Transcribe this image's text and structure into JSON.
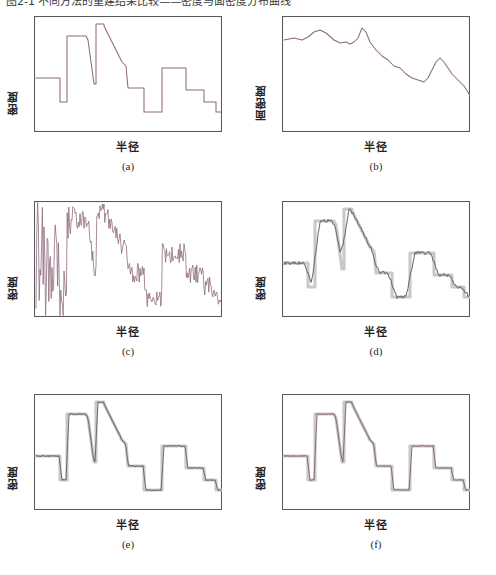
{
  "top_caption": "图2-1 不同方法的重建结果比较——密度与面密度分布曲线",
  "labels": {
    "density": "密度",
    "surface_density": "面密度",
    "radius": "半径"
  },
  "panels": [
    {
      "tag": "(a)",
      "ylabel": "密度",
      "xlabel": "半径",
      "name": "panel-a"
    },
    {
      "tag": "(b)",
      "ylabel": "面密度",
      "xlabel": "半径",
      "name": "panel-b"
    },
    {
      "tag": "(c)",
      "ylabel": "密度",
      "xlabel": "半径",
      "name": "panel-c"
    },
    {
      "tag": "(d)",
      "ylabel": "密度",
      "xlabel": "半径",
      "name": "panel-d"
    },
    {
      "tag": "(e)",
      "ylabel": "密度",
      "xlabel": "半径",
      "name": "panel-e"
    },
    {
      "tag": "(f)",
      "ylabel": "密度",
      "xlabel": "半径",
      "name": "panel-f"
    }
  ],
  "colors": {
    "trace": "#8d6a7c",
    "reference": "#c9c9c9",
    "reconstruction_gray": "#6d6d6d",
    "frame": "#5a5a5a",
    "background": "#ffffff"
  },
  "chart_data": [
    {
      "type": "line",
      "id": "a",
      "title": "(a)",
      "xlabel": "半径",
      "ylabel": "密度",
      "description": "原始分段常数/斜坡密度剖面",
      "xlim": [
        0,
        188
      ],
      "ylim": [
        0,
        116
      ],
      "grid": false,
      "legend": null,
      "points": [
        [
          2,
          62
        ],
        [
          26,
          62
        ],
        [
          26,
          86
        ],
        [
          33,
          86
        ],
        [
          33,
          20
        ],
        [
          52,
          20
        ],
        [
          54,
          24
        ],
        [
          60,
          68
        ],
        [
          62,
          68
        ],
        [
          62,
          8
        ],
        [
          70,
          8
        ],
        [
          70,
          10
        ],
        [
          88,
          46
        ],
        [
          92,
          50
        ],
        [
          94,
          72
        ],
        [
          110,
          72
        ],
        [
          110,
          96
        ],
        [
          128,
          96
        ],
        [
          128,
          52
        ],
        [
          152,
          52
        ],
        [
          152,
          74
        ],
        [
          170,
          74
        ],
        [
          170,
          86
        ],
        [
          182,
          86
        ],
        [
          182,
          96
        ],
        [
          187,
          96
        ]
      ]
    },
    {
      "type": "line",
      "id": "b",
      "title": "(b)",
      "xlabel": "半径",
      "ylabel": "面密度",
      "description": "对应的面密度(积分后)平滑下降曲线",
      "xlim": [
        0,
        188
      ],
      "ylim": [
        0,
        116
      ],
      "grid": false,
      "legend": null,
      "points": [
        [
          2,
          24
        ],
        [
          12,
          22
        ],
        [
          20,
          24
        ],
        [
          26,
          21
        ],
        [
          32,
          16
        ],
        [
          38,
          14
        ],
        [
          44,
          17
        ],
        [
          52,
          24
        ],
        [
          58,
          27
        ],
        [
          64,
          26
        ],
        [
          68,
          28
        ],
        [
          72,
          26
        ],
        [
          76,
          22
        ],
        [
          80,
          12
        ],
        [
          84,
          16
        ],
        [
          88,
          26
        ],
        [
          94,
          34
        ],
        [
          100,
          40
        ],
        [
          106,
          44
        ],
        [
          112,
          50
        ],
        [
          118,
          52
        ],
        [
          124,
          58
        ],
        [
          130,
          62
        ],
        [
          136,
          64
        ],
        [
          142,
          66
        ],
        [
          146,
          62
        ],
        [
          150,
          54
        ],
        [
          154,
          46
        ],
        [
          158,
          42
        ],
        [
          162,
          46
        ],
        [
          166,
          52
        ],
        [
          170,
          58
        ],
        [
          174,
          62
        ],
        [
          178,
          66
        ],
        [
          182,
          70
        ],
        [
          186,
          76
        ],
        [
          188,
          80
        ]
      ]
    },
    {
      "type": "line",
      "id": "c",
      "title": "(c)",
      "xlabel": "半径",
      "ylabel": "密度",
      "description": "含强噪声的直接反演结果,低半径处发散",
      "xlim": [
        0,
        188
      ],
      "ylim": [
        0,
        116
      ],
      "grid": false,
      "legend": null,
      "noise_amplitude_high": 50,
      "noise_amplitude_low": 10
    },
    {
      "type": "line",
      "id": "d",
      "title": "(d)",
      "xlabel": "半径",
      "ylabel": "密度",
      "description": "正则化重建(过平滑),灰色为真值剖面",
      "xlim": [
        0,
        188
      ],
      "ylim": [
        0,
        116
      ],
      "grid": false,
      "legend": [
        "真值",
        "重建"
      ]
    },
    {
      "type": "line",
      "id": "e",
      "title": "(e)",
      "xlabel": "半径",
      "ylabel": "密度",
      "description": "改进方法重建,与真值吻合良好",
      "xlim": [
        0,
        188
      ],
      "ylim": [
        0,
        116
      ],
      "grid": false,
      "legend": [
        "真值",
        "重建"
      ]
    },
    {
      "type": "line",
      "id": "f",
      "title": "(f)",
      "xlabel": "半径",
      "ylabel": "密度",
      "description": "最终方法重建,边界锐度最佳",
      "xlim": [
        0,
        188
      ],
      "ylim": [
        0,
        116
      ],
      "grid": false,
      "legend": [
        "真值",
        "重建"
      ]
    }
  ]
}
